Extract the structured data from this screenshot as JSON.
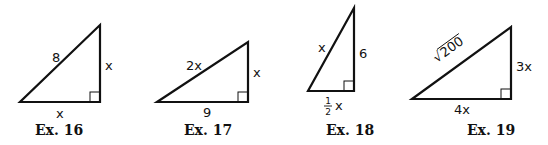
{
  "figures": [
    {
      "caption": "Ex. 16",
      "hypotenuse": "8",
      "vertical_leg": "x",
      "horizontal_leg": "x",
      "right_angle": "bottom-right"
    },
    {
      "caption": "Ex. 17",
      "hypotenuse": "2x",
      "vertical_leg": "x",
      "horizontal_leg": "9",
      "right_angle": "bottom-right"
    },
    {
      "caption": "Ex. 18",
      "hypotenuse": "x",
      "vertical_leg": "6",
      "horizontal_leg_fraction_num": "1",
      "horizontal_leg_fraction_den": "2",
      "horizontal_leg_var": "x",
      "right_angle": "bottom-right"
    },
    {
      "caption": "Ex. 19",
      "hypotenuse_radicand": "200",
      "radical_symbol": "√",
      "vertical_leg": "3x",
      "horizontal_leg": "4x",
      "right_angle": "bottom-right"
    }
  ]
}
